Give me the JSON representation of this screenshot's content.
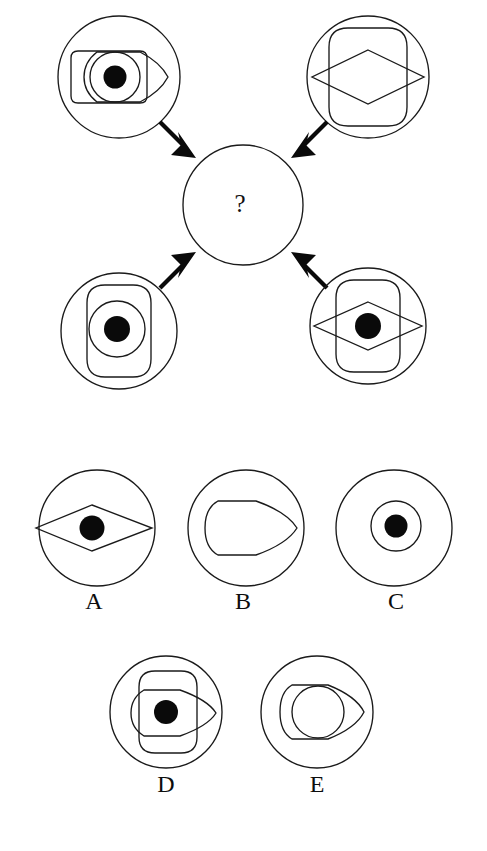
{
  "puzzle": {
    "type": "visual-analogy-matrix",
    "question_mark": "?",
    "layout": {
      "canvas_width": 487,
      "canvas_height": 851,
      "background_color": "#ffffff",
      "stroke_color": "#1a1a1a",
      "fill_color": "#0a0a0a"
    },
    "center": {
      "label": "?",
      "cx": 243,
      "cy": 205,
      "r": 60
    },
    "stimuli": [
      {
        "id": "top-left",
        "name": "stimulus-top-left",
        "position": "top-left",
        "cx": 119,
        "cy": 77,
        "outer_radius": 61,
        "elements": [
          "outer-circle",
          "rounded-rectangle-horizontal",
          "bullet-right",
          "inner-circle",
          "black-dot"
        ],
        "has_dot": true
      },
      {
        "id": "top-right",
        "name": "stimulus-top-right",
        "position": "top-right",
        "cx": 368,
        "cy": 77,
        "outer_radius": 61,
        "elements": [
          "outer-circle",
          "rounded-rectangle-vertical",
          "diamond"
        ],
        "has_dot": false
      },
      {
        "id": "bottom-left",
        "name": "stimulus-bottom-left",
        "position": "bottom-left",
        "cx": 119,
        "cy": 331,
        "outer_radius": 58,
        "elements": [
          "outer-circle",
          "rounded-rectangle-vertical",
          "inner-circle",
          "black-dot"
        ],
        "has_dot": true
      },
      {
        "id": "bottom-right",
        "name": "stimulus-bottom-right",
        "position": "bottom-right",
        "cx": 368,
        "cy": 326,
        "outer_radius": 58,
        "elements": [
          "outer-circle",
          "rounded-rectangle-vertical",
          "diamond",
          "black-dot"
        ],
        "has_dot": true
      }
    ],
    "arrows": [
      {
        "id": "arrow-from-top-left",
        "name": "arrow-top-left-to-center",
        "direction": "down-right"
      },
      {
        "id": "arrow-from-top-right",
        "name": "arrow-top-right-to-center",
        "direction": "down-left"
      },
      {
        "id": "arrow-from-bottom-left",
        "name": "arrow-bottom-left-to-center",
        "direction": "up-right"
      },
      {
        "id": "arrow-from-bottom-right",
        "name": "arrow-bottom-right-to-center",
        "direction": "up-left"
      }
    ],
    "options": [
      {
        "id": "A",
        "label": "A",
        "cx": 97,
        "cy": 528,
        "outer_radius": 58,
        "elements": [
          "outer-circle",
          "diamond",
          "black-dot"
        ],
        "has_dot": true
      },
      {
        "id": "B",
        "label": "B",
        "cx": 246,
        "cy": 528,
        "outer_radius": 58,
        "elements": [
          "outer-circle",
          "bullet-right"
        ],
        "has_dot": false
      },
      {
        "id": "C",
        "label": "C",
        "cx": 394,
        "cy": 528,
        "outer_radius": 58,
        "elements": [
          "outer-circle",
          "inner-circle",
          "black-dot"
        ],
        "has_dot": true
      },
      {
        "id": "D",
        "label": "D",
        "cx": 166,
        "cy": 712,
        "outer_radius": 56,
        "elements": [
          "outer-circle",
          "rounded-rectangle-vertical",
          "bullet-right",
          "black-dot"
        ],
        "has_dot": true
      },
      {
        "id": "E",
        "label": "E",
        "cx": 317,
        "cy": 712,
        "outer_radius": 56,
        "elements": [
          "outer-circle",
          "bullet-right",
          "inner-circle"
        ],
        "has_dot": false
      }
    ]
  }
}
